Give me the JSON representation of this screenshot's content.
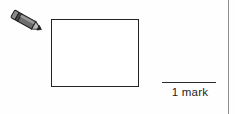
{
  "page": {
    "background_color": "#fefefe",
    "width": 235,
    "height": 114
  },
  "pencil": {
    "icon": "pencil-icon",
    "body_color": "#6e6e6e",
    "body_dark_color": "#3f3f3f",
    "tip_color": "#2a2a2a",
    "outline_color": "#1f1f1f"
  },
  "answer_box": {
    "name": "blank-answer-rectangle",
    "value": "",
    "border_color": "#232323",
    "fill_color": "#ffffff"
  },
  "marks": {
    "label": "1 mark",
    "rule_color": "#2b2b2b",
    "text_color": "#1d1d1d"
  },
  "page_edge": {
    "name": "page-edge-rule",
    "color": "#8c8c8c"
  }
}
